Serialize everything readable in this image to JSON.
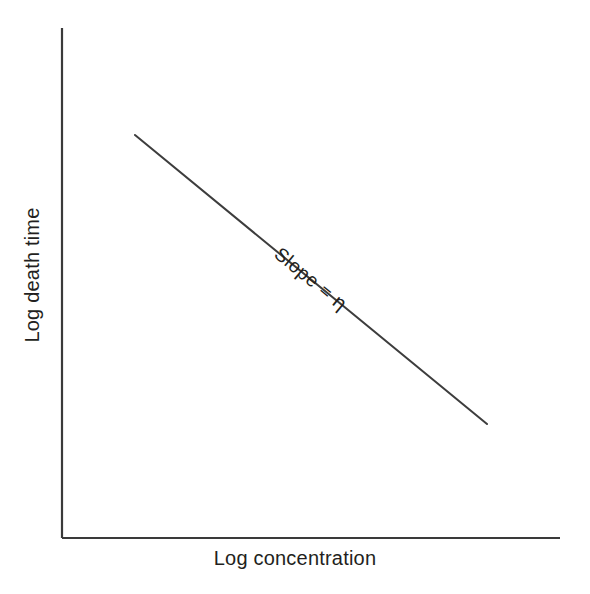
{
  "figure": {
    "background_color": "#ffffff",
    "width": 590,
    "height": 594
  },
  "chart_data": {
    "type": "line",
    "title": "",
    "subtitle": "",
    "xlabel": "Log concentration",
    "ylabel": "Log death time",
    "grid": false,
    "legend": null,
    "legend_position": "none",
    "xlim": [
      0,
      1
    ],
    "ylim": [
      0,
      1
    ],
    "xticks": [],
    "yticks": [],
    "xticklabels": [],
    "yticklabels": [],
    "axis_style": "L-shaped spines (left and bottom only)",
    "axis_color": "#3a3a3a",
    "line_color": "#3d3d3d",
    "series": [
      {
        "name": "Survivor curve slope line",
        "x": [
          0.147,
          0.853
        ],
        "y": [
          0.791,
          0.224
        ],
        "style": "solid straight line, descending",
        "slope_pixels": -0.821,
        "angle_degrees": -39.4,
        "endpoints_px": [
          [
            135,
            135
          ],
          [
            487,
            424
          ]
        ]
      }
    ],
    "annotations": [
      {
        "text_prefix": "Slope = ",
        "symbol": "η",
        "full_text": "Slope = η",
        "rotated": true,
        "rotation_degrees": 39.4,
        "position_px": [
          311,
          279
        ],
        "placement": "above the line, aligned with line direction"
      }
    ]
  }
}
